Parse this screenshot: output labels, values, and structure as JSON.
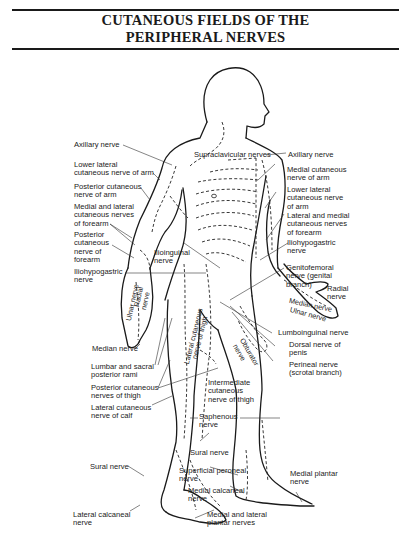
{
  "title": {
    "line1": "CUTANEOUS FIELDS OF THE",
    "line2": "PERIPHERAL NERVES"
  },
  "labels_left": [
    {
      "id": "axillary-nerve-left",
      "lines": [
        "Axillary nerve"
      ]
    },
    {
      "id": "lower-lateral-cutaneous-arm-left",
      "lines": [
        "Lower lateral",
        "cutaneous nerve of arm"
      ]
    },
    {
      "id": "posterior-cutaneous-arm",
      "lines": [
        "Posterior cutaneous",
        "nerve of arm"
      ]
    },
    {
      "id": "medial-lateral-cutaneous-forearm-left",
      "lines": [
        "Medial and lateral",
        "cutaneous nerves",
        "of forearm"
      ]
    },
    {
      "id": "posterior-cutaneous-forearm",
      "lines": [
        "Posterior",
        "cutaneous",
        "nerve of",
        "forearm"
      ]
    },
    {
      "id": "iliohypogastric-left",
      "lines": [
        "Iliohypogastric",
        "nerve"
      ]
    },
    {
      "id": "median-nerve-left",
      "lines": [
        "Median nerve"
      ]
    },
    {
      "id": "lumbar-sacral-rami",
      "lines": [
        "Lumbar and sacral",
        "posterior rami"
      ]
    },
    {
      "id": "posterior-cutaneous-thigh",
      "lines": [
        "Posterior cutaneous",
        "nerves of thigh"
      ]
    },
    {
      "id": "lateral-cutaneous-calf",
      "lines": [
        "Lateral cutaneous",
        "nerve of calf"
      ]
    },
    {
      "id": "sural-nerve-left",
      "lines": [
        "Sural nerve"
      ]
    },
    {
      "id": "lateral-calcaneal",
      "lines": [
        "Lateral calcaneal",
        "nerve"
      ]
    }
  ],
  "labels_right": [
    {
      "id": "axillary-nerve-right",
      "lines": [
        "Axillary nerve"
      ]
    },
    {
      "id": "medial-cutaneous-arm",
      "lines": [
        "Medial cutaneous",
        "nerve of arm"
      ]
    },
    {
      "id": "lower-lateral-cutaneous-arm-right",
      "lines": [
        "Lower lateral",
        "cutaneous nerve",
        "of arm"
      ]
    },
    {
      "id": "lateral-medial-cutaneous-forearm-right",
      "lines": [
        "Lateral and medial",
        "cutaneous nerves",
        "of forearm"
      ]
    },
    {
      "id": "iliohypogastric-right",
      "lines": [
        "Iliohypogastric",
        "nerve"
      ]
    },
    {
      "id": "genitofemoral",
      "lines": [
        "Genitofemoral",
        "nerve (genital",
        "branch)"
      ]
    },
    {
      "id": "radial-nerve-right",
      "lines": [
        "Radial",
        "nerve"
      ]
    },
    {
      "id": "lumboinguinal",
      "lines": [
        "Lumboinguinal nerve"
      ]
    },
    {
      "id": "dorsal-nerve-penis",
      "lines": [
        "Dorsal nerve of",
        "penis"
      ]
    },
    {
      "id": "perineal-nerve",
      "lines": [
        "Perineal nerve",
        "(scrotal branch)"
      ]
    },
    {
      "id": "medial-plantar",
      "lines": [
        "Medial plantar",
        "nerve"
      ]
    }
  ],
  "labels_center": [
    {
      "id": "supraclavicular",
      "lines": [
        "Supraclavicular nerves"
      ]
    },
    {
      "id": "ilioinguinal",
      "lines": [
        "Ilioinguinal",
        "nerve"
      ]
    },
    {
      "id": "intermediate-cutaneous-thigh",
      "lines": [
        "Intermediate",
        "cutaneous",
        "nerve of thigh"
      ]
    },
    {
      "id": "saphenous",
      "lines": [
        "Saphenous",
        "nerve"
      ]
    },
    {
      "id": "sural-nerve-center",
      "lines": [
        "Sural nerve"
      ]
    },
    {
      "id": "superficial-peroneal",
      "lines": [
        "Superficial peroneal",
        "nerve"
      ]
    },
    {
      "id": "medial-calcaneal",
      "lines": [
        "Medial calcaneal",
        "nerve"
      ]
    },
    {
      "id": "medial-lateral-plantar",
      "lines": [
        "Medial and lateral",
        "plantar nerves"
      ]
    }
  ],
  "labels_on_body": {
    "median_nerve_hand": "Median nerve",
    "ulnar_nerve_hand_right": "Ulnar nerve",
    "ulnar_nerve_hand_left": "Ulnar nerve",
    "radial_nerve_hand_left": "Radial",
    "radial_nerve_hand_left_2": "nerve",
    "lateral_cutaneous_thigh_1": "Lateral cutaneous",
    "lateral_cutaneous_thigh_2": "nerve of thigh",
    "obturator_1": "Obturator",
    "obturator_2": "nerve"
  }
}
